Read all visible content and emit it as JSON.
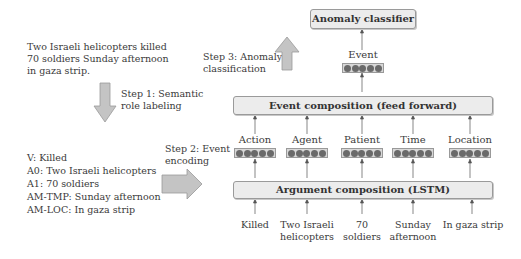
{
  "input_sentence": [
    "Two Israeli helicopters killed",
    "70 soldiers Sunday afternoon",
    "in gaza strip."
  ],
  "steps": {
    "step1": [
      "Step 1: Semantic",
      "role labeling"
    ],
    "step2": [
      "Step 2: Event",
      "encoding"
    ],
    "step3": [
      "Step 3: Anomaly",
      "classification"
    ]
  },
  "srl_output": [
    "V: Killed",
    "A0: Two Israeli helicopters",
    "A1: 70 soldiers",
    "AM-TMP: Sunday afternoon",
    "AM-LOC: In gaza strip"
  ],
  "boxes": {
    "classifier": "Anomaly classifier",
    "event_composition": "Event composition (feed forward)",
    "argument_composition": "Argument composition (LSTM)"
  },
  "event_label": "Event",
  "roles": [
    "Action",
    "Agent",
    "Patient",
    "Time",
    "Location"
  ],
  "inputs": [
    [
      "Killed"
    ],
    [
      "Two Israeli",
      "helicopters"
    ],
    [
      "70",
      "soldiers"
    ],
    [
      "Sunday",
      "afternoon"
    ],
    [
      "In gaza strip"
    ]
  ],
  "colors": {
    "box_fill": "#ececec",
    "arrow_fill": "#c4c4c4",
    "dot": "#6a6a6a"
  }
}
